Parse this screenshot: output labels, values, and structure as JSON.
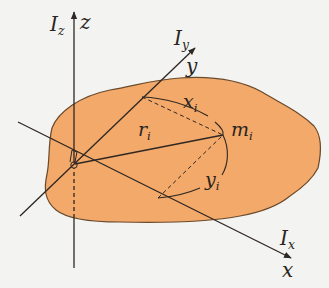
{
  "diagram": {
    "colors": {
      "background": "#f3f3f1",
      "body_fill": "#f2a96a",
      "body_edge": "#6b4a2c",
      "line": "#2f2722"
    },
    "axes": {
      "z": {
        "name": "z",
        "moment": "I",
        "moment_sub": "z"
      },
      "y": {
        "name": "y",
        "moment": "I",
        "moment_sub": "y"
      },
      "x": {
        "name": "x",
        "moment": "I",
        "moment_sub": "x"
      }
    },
    "labels": {
      "mass": {
        "main": "m",
        "sub": "i"
      },
      "radius": {
        "main": "r",
        "sub": "i"
      },
      "x_dist": {
        "main": "x",
        "sub": "i"
      },
      "y_dist": {
        "main": "y",
        "sub": "i"
      }
    }
  }
}
